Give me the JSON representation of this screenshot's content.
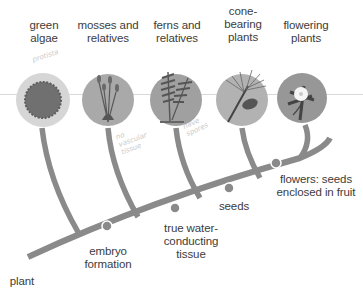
{
  "diagram": {
    "type": "cladogram",
    "root_label": "plant",
    "groups": [
      {
        "id": "green-algae",
        "label_line1": "green",
        "label_line2": "algae",
        "label_line0": ""
      },
      {
        "id": "mosses",
        "label_line1": "mosses and",
        "label_line2": "relatives",
        "label_line0": ""
      },
      {
        "id": "ferns",
        "label_line1": "ferns and",
        "label_line2": "relatives",
        "label_line0": ""
      },
      {
        "id": "cone-bearing",
        "label_line0": "cone-",
        "label_line1": "bearing",
        "label_line2": "plants"
      },
      {
        "id": "flowering",
        "label_line1": "flowering",
        "label_line2": "plants",
        "label_line0": ""
      }
    ],
    "traits": [
      {
        "id": "embryo",
        "line1": "embryo",
        "line2": "formation",
        "line3": ""
      },
      {
        "id": "water",
        "line1": "true water-",
        "line2": "conducting",
        "line3": "tissue"
      },
      {
        "id": "seeds",
        "line1": "seeds",
        "line2": "",
        "line3": ""
      },
      {
        "id": "flowers",
        "line1": "flowers: seeds",
        "line2": "enclosed in fruit",
        "line3": ""
      }
    ],
    "annotations": [
      {
        "id": "ann-algae",
        "text": "protista"
      },
      {
        "id": "ann-moss",
        "line1": "no",
        "line2": "vascular",
        "line3": "tissue"
      },
      {
        "id": "ann-fern",
        "line1": "have",
        "line2": "spores"
      }
    ],
    "colors": {
      "branch": "#8a8a8a",
      "node": "#8a8a8a",
      "algae_outer": "#d4d4d4",
      "algae_inner": "#6e6e6e",
      "circle_fill": "#a9a9a9",
      "circle_dark": "#8f8f8f",
      "plant_dark": "#5a5a5a",
      "flower_petal": "#f5f5f5"
    }
  }
}
